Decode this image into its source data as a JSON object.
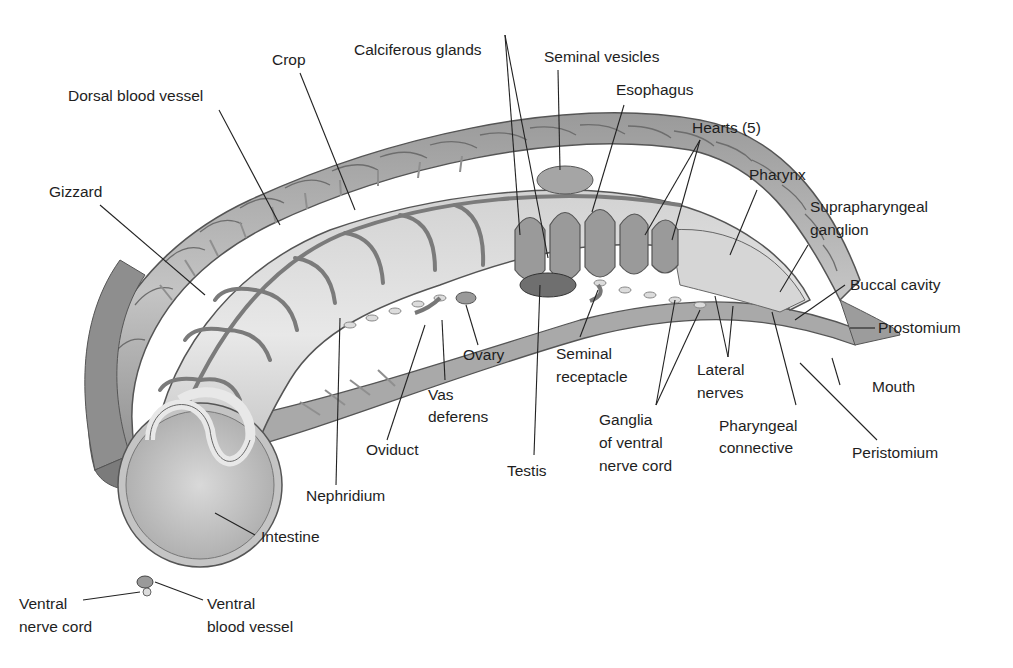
{
  "diagram": {
    "colors": {
      "background": "#ffffff",
      "body_wall_dark": "#8a8a8a",
      "body_wall_mid": "#a8a8a8",
      "body_wall_light": "#c9c9c9",
      "gut_light": "#dcdcdc",
      "vessel": "#7d7d7d",
      "leader_line": "#222222",
      "text": "#1e1e1e"
    },
    "labels": [
      {
        "id": "crop",
        "lines": [
          "Crop"
        ]
      },
      {
        "id": "calciferous-glands",
        "lines": [
          "Calciferous glands"
        ]
      },
      {
        "id": "seminal-vesicles",
        "lines": [
          "Seminal vesicles"
        ]
      },
      {
        "id": "esophagus",
        "lines": [
          "Esophagus"
        ]
      },
      {
        "id": "dorsal-blood-vessel",
        "lines": [
          "Dorsal blood vessel"
        ]
      },
      {
        "id": "hearts",
        "lines": [
          "Hearts (5)"
        ]
      },
      {
        "id": "pharynx",
        "lines": [
          "Pharynx"
        ]
      },
      {
        "id": "gizzard",
        "lines": [
          "Gizzard"
        ]
      },
      {
        "id": "suprapharyngeal-ganglion",
        "lines": [
          "Suprapharyngeal",
          "ganglion"
        ]
      },
      {
        "id": "buccal-cavity",
        "lines": [
          "Buccal cavity"
        ]
      },
      {
        "id": "prostomium",
        "lines": [
          "Prostomium"
        ]
      },
      {
        "id": "ovary",
        "lines": [
          "Ovary"
        ]
      },
      {
        "id": "seminal-receptacle",
        "lines": [
          "Seminal",
          "receptacle"
        ]
      },
      {
        "id": "lateral-nerves",
        "lines": [
          "Lateral",
          "nerves"
        ]
      },
      {
        "id": "mouth",
        "lines": [
          "Mouth"
        ]
      },
      {
        "id": "vas-deferens",
        "lines": [
          "Vas",
          "deferens"
        ]
      },
      {
        "id": "ganglia-ventral-nerve-cord",
        "lines": [
          "Ganglia",
          "of ventral",
          "nerve cord"
        ]
      },
      {
        "id": "pharyngeal-connective",
        "lines": [
          "Pharyngeal",
          "connective"
        ]
      },
      {
        "id": "peristomium",
        "lines": [
          "Peristomium"
        ]
      },
      {
        "id": "oviduct",
        "lines": [
          "Oviduct"
        ]
      },
      {
        "id": "testis",
        "lines": [
          "Testis"
        ]
      },
      {
        "id": "nephridium",
        "lines": [
          "Nephridium"
        ]
      },
      {
        "id": "intestine",
        "lines": [
          "Intestine"
        ]
      },
      {
        "id": "ventral-nerve-cord",
        "lines": [
          "Ventral",
          "nerve cord"
        ]
      },
      {
        "id": "ventral-blood-vessel",
        "lines": [
          "Ventral",
          "blood vessel"
        ]
      }
    ]
  }
}
